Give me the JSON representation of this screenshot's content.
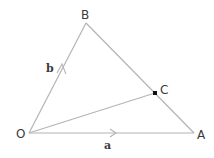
{
  "diagram": {
    "type": "vector-triangle",
    "points": {
      "O": {
        "label": "O",
        "x": 29,
        "y": 133
      },
      "A": {
        "label": "A",
        "x": 194,
        "y": 133
      },
      "B": {
        "label": "B",
        "x": 86,
        "y": 23
      },
      "C": {
        "label": "C",
        "x": 155,
        "y": 93
      }
    },
    "vectors": {
      "a": {
        "label": "a",
        "from": "O",
        "to": "A"
      },
      "b": {
        "label": "b",
        "from": "O",
        "to": "B"
      }
    },
    "segments": [
      {
        "from": "O",
        "to": "A"
      },
      {
        "from": "O",
        "to": "B"
      },
      {
        "from": "B",
        "to": "A"
      },
      {
        "from": "O",
        "to": "C"
      }
    ],
    "colors": {
      "line": "#b4b4b4",
      "text": "#3a3a3a",
      "point": "#111111"
    }
  }
}
